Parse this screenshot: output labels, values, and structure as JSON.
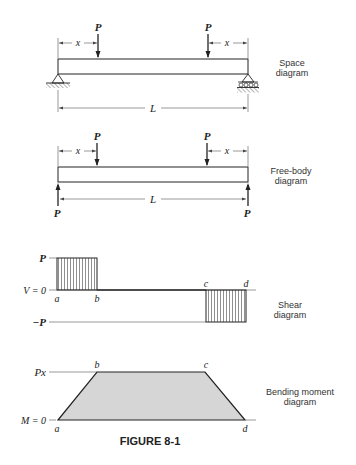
{
  "figure": {
    "caption": "FIGURE 8-1"
  },
  "space_diagram": {
    "label_line1": "Space",
    "label_line2": "diagram",
    "load_left": "P",
    "load_right": "P",
    "dim_left": "x",
    "dim_right": "x",
    "span": "L"
  },
  "free_body_diagram": {
    "label_line1": "Free-body",
    "label_line2": "diagram",
    "load_left": "P",
    "load_right": "P",
    "reaction_left": "P",
    "reaction_right": "P",
    "dim_left": "x",
    "dim_right": "x",
    "span": "L"
  },
  "shear_diagram": {
    "label_line1": "Shear",
    "label_line2": "diagram",
    "y_top": "P",
    "y_zero": "V = 0",
    "y_bottom": "−P",
    "point_a": "a",
    "point_b": "b",
    "point_c": "c",
    "point_d": "d"
  },
  "moment_diagram": {
    "label_line1": "Bending moment",
    "label_line2": "diagram",
    "y_top": "Px",
    "y_zero": "M = 0",
    "point_a": "a",
    "point_b": "b",
    "point_c": "c",
    "point_d": "d",
    "fill_color": "#d6d6d6"
  }
}
